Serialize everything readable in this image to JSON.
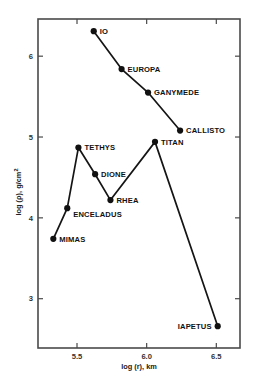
{
  "chart_data": {
    "type": "line",
    "title": "",
    "xlabel": "log (r), km",
    "ylabel": "log (ρ), g/cm²",
    "xlim": [
      5.22,
      6.67
    ],
    "ylim": [
      2.39,
      6.46
    ],
    "xticks": [
      5.5,
      6.0,
      6.5
    ],
    "xticklabels": [
      "5.5",
      "6.0",
      "6.5"
    ],
    "yticks": [
      3,
      4,
      5,
      6
    ],
    "yticklabels": [
      "3",
      "4",
      "5",
      "6"
    ],
    "grid": false,
    "legend": null,
    "series": [
      {
        "name": "Galilean satellites of Jupiter",
        "points": [
          {
            "label": "IO",
            "x": 5.62,
            "y": 6.31,
            "label_pos": "right"
          },
          {
            "label": "EUROPA",
            "x": 5.82,
            "y": 5.84,
            "label_pos": "right"
          },
          {
            "label": "GANYMEDE",
            "x": 6.01,
            "y": 5.55,
            "label_pos": "right"
          },
          {
            "label": "CALLISTO",
            "x": 6.24,
            "y": 5.08,
            "label_pos": "right"
          }
        ]
      },
      {
        "name": "Satellites of Saturn",
        "points": [
          {
            "label": "MIMAS",
            "x": 5.33,
            "y": 3.74,
            "label_pos": "right"
          },
          {
            "label": "ENCELADUS",
            "x": 5.43,
            "y": 4.12,
            "label_pos": "below-right"
          },
          {
            "label": "TETHYS",
            "x": 5.51,
            "y": 4.87,
            "label_pos": "right"
          },
          {
            "label": "DIONE",
            "x": 5.63,
            "y": 4.54,
            "label_pos": "right"
          },
          {
            "label": "RHEA",
            "x": 5.74,
            "y": 4.22,
            "label_pos": "right"
          },
          {
            "label": "TITAN",
            "x": 6.06,
            "y": 4.94,
            "label_pos": "right"
          },
          {
            "label": "IAPETUS",
            "x": 6.51,
            "y": 2.66,
            "label_pos": "left"
          }
        ]
      }
    ]
  },
  "caption": {
    "text": ""
  }
}
